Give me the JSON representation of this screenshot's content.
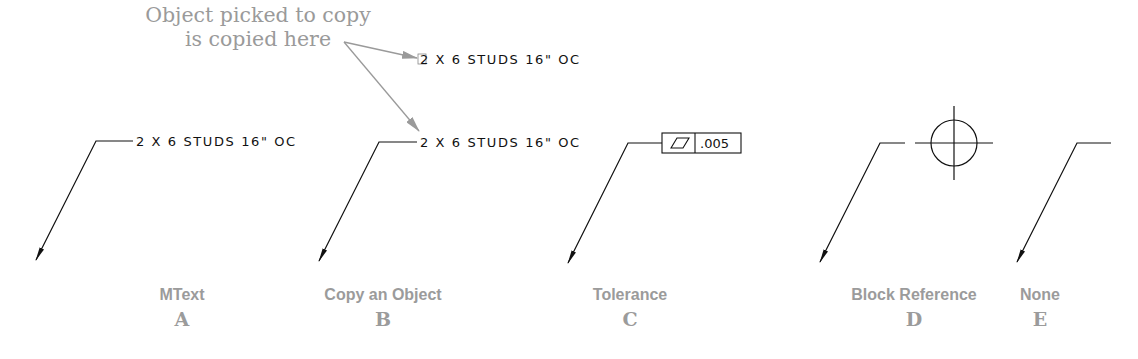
{
  "callout": {
    "line1": "Object picked to copy",
    "line2": "is copied here"
  },
  "annotations": {
    "mtext": "2 X 6 STUDS 16\" OC",
    "copied_top": "2 X 6 STUDS 16\" OC",
    "copied_bottom": "2 X 6 STUDS 16\" OC",
    "tolerance_value": ".005",
    "tolerance_symbol": "flatness-parallelogram"
  },
  "panels": [
    {
      "name": "MText",
      "letter": "A"
    },
    {
      "name": "Copy an Object",
      "letter": "B"
    },
    {
      "name": "Tolerance",
      "letter": "C"
    },
    {
      "name": "Block Reference",
      "letter": "D"
    },
    {
      "name": "None",
      "letter": "E"
    }
  ],
  "colors": {
    "line": "#111111",
    "callout": "#9a9a9a",
    "label": "#9b9b9b"
  }
}
